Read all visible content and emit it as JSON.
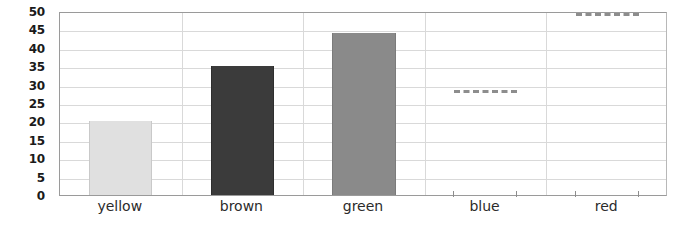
{
  "chart_data": {
    "type": "bar",
    "title": "",
    "xlabel": "",
    "ylabel": "",
    "categories": [
      "yellow",
      "brown",
      "green",
      "blue",
      "red"
    ],
    "values": [
      20,
      35,
      44,
      29,
      50
    ],
    "bar_colors": [
      "#e0e0e0",
      "#3b3b3b",
      "#8a8a8a",
      "",
      ""
    ],
    "bar_border_colors": [
      "#c9c9c9",
      "#2e2e2e",
      "#7b7b7b",
      "",
      ""
    ],
    "bar_rendered": [
      true,
      true,
      true,
      false,
      false
    ],
    "marker_style": [
      "none",
      "none",
      "none",
      "dashed-line",
      "dashed-line"
    ],
    "marker_color": "#8d8d8d",
    "ylim": [
      0,
      50
    ],
    "yticks": [
      0,
      5,
      10,
      15,
      20,
      25,
      30,
      35,
      40,
      45,
      50
    ],
    "ytick_labels": [
      "0",
      "5",
      "10",
      "15",
      "20",
      "25",
      "30",
      "35",
      "40",
      "45",
      "50"
    ],
    "grid": true,
    "grid_color": "#d9d9d9",
    "legend": "none"
  },
  "clipped_text": {
    "top": "",
    "bottom": ""
  }
}
